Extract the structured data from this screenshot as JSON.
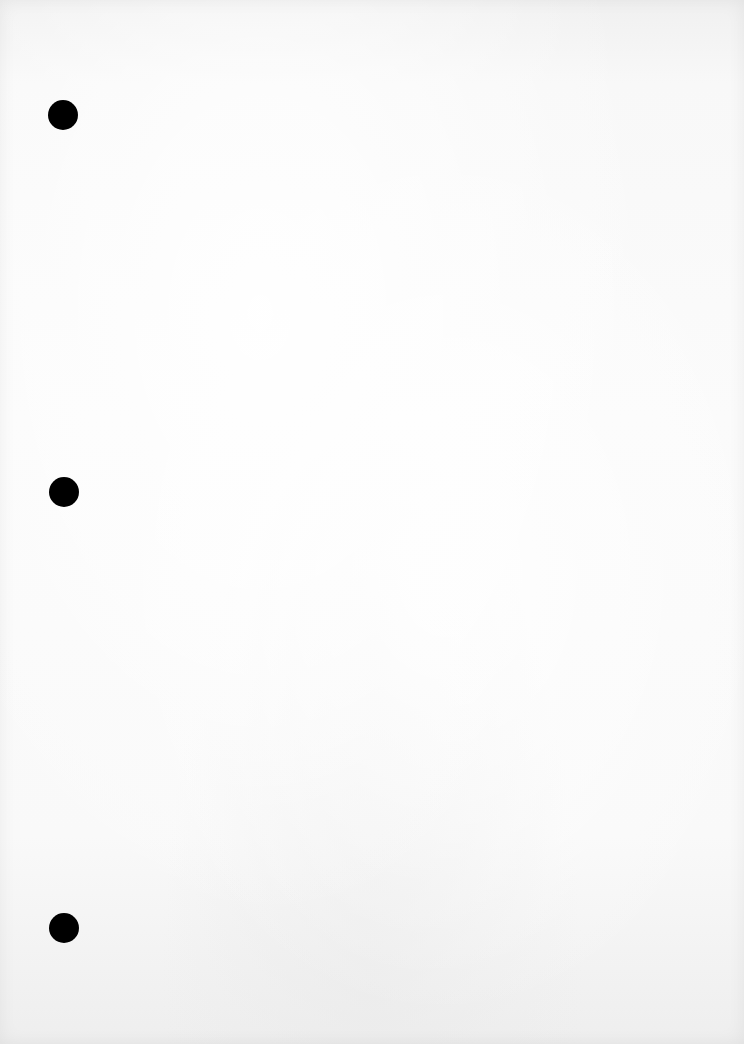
{
  "page": {
    "type": "blank-loose-leaf-paper",
    "background_color": "#f7f7f7",
    "punch_holes": [
      {
        "x": 63,
        "y": 115,
        "diameter": 30,
        "color": "#000000"
      },
      {
        "x": 64,
        "y": 492,
        "diameter": 30,
        "color": "#000000"
      },
      {
        "x": 64,
        "y": 928,
        "diameter": 30,
        "color": "#000000"
      }
    ]
  }
}
